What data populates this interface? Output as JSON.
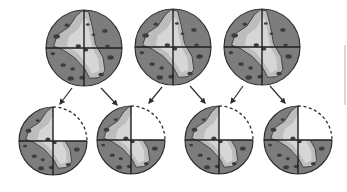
{
  "diagram": {
    "colors": {
      "dark_fill": "#7d7d7d",
      "light_fill": "#bdbdbd",
      "lighter_fill": "#d6d6d6",
      "outline": "#2e2e2e",
      "spot": "#3d3d3d",
      "missing_quadrant_outline": "#2e2e2e"
    },
    "top_row": [
      {
        "id": "sphere-1",
        "cx": 84,
        "cy": 48,
        "r": 38
      },
      {
        "id": "sphere-2",
        "cx": 173,
        "cy": 47,
        "r": 38
      },
      {
        "id": "sphere-3",
        "cx": 262,
        "cy": 47,
        "r": 38
      }
    ],
    "bottom_row": [
      {
        "id": "sectioned-1",
        "cx": 53,
        "cy": 141,
        "r": 34,
        "missing_quadrant": "top-right"
      },
      {
        "id": "sectioned-2",
        "cx": 131,
        "cy": 140,
        "r": 34,
        "missing_quadrant": "top-right"
      },
      {
        "id": "sectioned-3",
        "cx": 219,
        "cy": 140,
        "r": 34,
        "missing_quadrant": "top-right"
      },
      {
        "id": "sectioned-4",
        "cx": 298,
        "cy": 140,
        "r": 34,
        "missing_quadrant": "top-right"
      }
    ],
    "arrows": [
      {
        "from": "sphere-1",
        "to": "sectioned-1",
        "x1": 72,
        "y1": 88,
        "x2": 60,
        "y2": 104
      },
      {
        "from": "sphere-1",
        "to": "sectioned-2",
        "x1": 101,
        "y1": 88,
        "x2": 117,
        "y2": 105
      },
      {
        "from": "sphere-2",
        "to": "sectioned-2",
        "x1": 162,
        "y1": 87,
        "x2": 149,
        "y2": 103
      },
      {
        "from": "sphere-2",
        "to": "sectioned-3",
        "x1": 190,
        "y1": 86,
        "x2": 205,
        "y2": 103
      },
      {
        "from": "sphere-3",
        "to": "sectioned-3",
        "x1": 243,
        "y1": 86,
        "x2": 231,
        "y2": 103
      },
      {
        "from": "sphere-3",
        "to": "sectioned-4",
        "x1": 270,
        "y1": 86,
        "x2": 285,
        "y2": 103
      }
    ]
  }
}
